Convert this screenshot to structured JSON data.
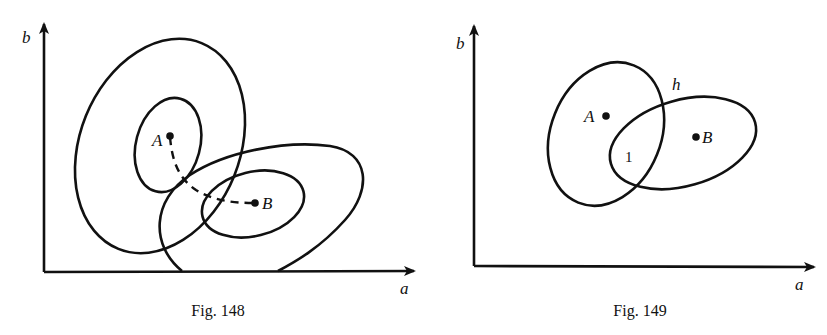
{
  "figures": [
    {
      "id": "fig148",
      "caption": "Fig. 148",
      "axes": {
        "x_label": "a",
        "y_label": "b"
      },
      "points": [
        {
          "label": "A"
        },
        {
          "label": "B"
        }
      ],
      "curves": [
        "outer contour around A",
        "inner contour around A",
        "outer contour around B",
        "inner contour around B",
        "dashed path from A to B"
      ]
    },
    {
      "id": "fig149",
      "caption": "Fig. 149",
      "axes": {
        "x_label": "a",
        "y_label": "b"
      },
      "points": [
        {
          "label": "A"
        },
        {
          "label": "B"
        }
      ],
      "annotations": {
        "curve_label": "h",
        "region_label": "1"
      },
      "curves": [
        "ellipse around A",
        "ellipse around B"
      ]
    }
  ]
}
